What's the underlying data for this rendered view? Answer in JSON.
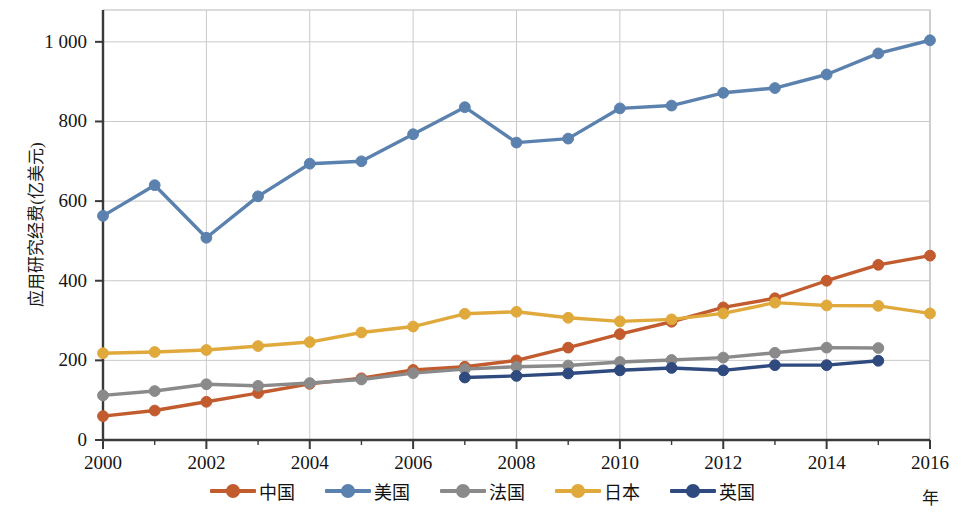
{
  "chart_data": {
    "type": "line",
    "title": "",
    "xlabel": "年",
    "ylabel": "应用研究经费(亿美元)",
    "xlim": [
      2000,
      2016
    ],
    "ylim": [
      0,
      1080
    ],
    "grid": true,
    "legend_position": "bottom",
    "x_ticks": [
      "2000",
      "2002",
      "2004",
      "2006",
      "2008",
      "2010",
      "2012",
      "2014",
      "2016"
    ],
    "y_ticks": [
      "0",
      "200",
      "400",
      "600",
      "800",
      "1 000"
    ],
    "y_tick_values": [
      0,
      200,
      400,
      600,
      800,
      1000
    ],
    "x": [
      2000,
      2001,
      2002,
      2003,
      2004,
      2005,
      2006,
      2007,
      2008,
      2009,
      2010,
      2011,
      2012,
      2013,
      2014,
      2015,
      2016
    ],
    "series": [
      {
        "name": "中国",
        "key": "china",
        "color": "#C25B2E",
        "x": [
          2000,
          2001,
          2002,
          2003,
          2004,
          2005,
          2006,
          2007,
          2008,
          2009,
          2010,
          2011,
          2012,
          2013,
          2014,
          2015,
          2016
        ],
        "values": [
          60,
          74,
          96,
          118,
          141,
          155,
          176,
          184,
          200,
          232,
          266,
          297,
          333,
          356,
          400,
          440,
          463
        ]
      },
      {
        "name": "美国",
        "key": "usa",
        "color": "#5B81AE",
        "x": [
          2000,
          2001,
          2002,
          2003,
          2004,
          2005,
          2006,
          2007,
          2008,
          2009,
          2010,
          2011,
          2012,
          2013,
          2014,
          2015,
          2016
        ],
        "values": [
          563,
          640,
          508,
          612,
          694,
          700,
          768,
          836,
          747,
          757,
          833,
          840,
          872,
          884,
          918,
          971,
          1004
        ]
      },
      {
        "name": "法国",
        "key": "france",
        "color": "#8A8A8A",
        "x": [
          2000,
          2001,
          2002,
          2003,
          2004,
          2005,
          2006,
          2007,
          2008,
          2009,
          2010,
          2011,
          2012,
          2013,
          2014,
          2015
        ],
        "values": [
          112,
          123,
          140,
          136,
          143,
          152,
          168,
          178,
          184,
          187,
          196,
          201,
          207,
          219,
          232,
          231
        ]
      },
      {
        "name": "日本",
        "key": "japan",
        "color": "#E0A93B",
        "x": [
          2000,
          2001,
          2002,
          2003,
          2004,
          2005,
          2006,
          2007,
          2008,
          2009,
          2010,
          2011,
          2012,
          2013,
          2014,
          2015,
          2016
        ],
        "values": [
          218,
          221,
          226,
          236,
          246,
          270,
          285,
          317,
          322,
          307,
          298,
          303,
          318,
          345,
          338,
          337,
          318
        ]
      },
      {
        "name": "英国",
        "key": "uk",
        "color": "#2F4A7E",
        "x": [
          2007,
          2008,
          2009,
          2010,
          2011,
          2012,
          2013,
          2014,
          2015
        ],
        "values": [
          157,
          161,
          167,
          175,
          181,
          175,
          188,
          188,
          199
        ]
      }
    ]
  },
  "axes": {
    "y_title": "应用研究经费(亿美元)",
    "x_title": "年"
  },
  "legend": {
    "items": [
      {
        "label": "中国",
        "color": "#C25B2E"
      },
      {
        "label": "美国",
        "color": "#5B81AE"
      },
      {
        "label": "法国",
        "color": "#8A8A8A"
      },
      {
        "label": "日本",
        "color": "#E0A93B"
      },
      {
        "label": "英国",
        "color": "#2F4A7E"
      }
    ]
  }
}
